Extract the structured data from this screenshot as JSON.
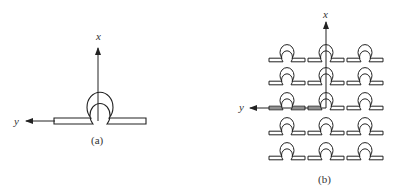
{
  "panel_a": {
    "caption": "(a)",
    "x_axis_label": "x",
    "y_axis_label": "y"
  },
  "panel_b": {
    "caption": "(b)",
    "x_axis_label": "x",
    "y_axis_label": "y",
    "grid": {
      "rows": 5,
      "columns": 3
    }
  },
  "colors": {
    "stroke": "#222222",
    "background": "#ffffff"
  }
}
